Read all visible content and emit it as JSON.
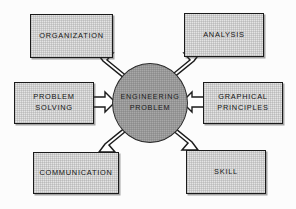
{
  "diagram": {
    "center": {
      "id": "engineering-problem",
      "label": "ENGINEERING\nPROBLEM",
      "shape": "circle",
      "fill_color": "#a8a8a8",
      "stroke_color": "#2a2a2a"
    },
    "nodes": [
      {
        "id": "organization",
        "label": "ORGANIZATION",
        "position": "top-left",
        "fill_color": "#e4e4e4",
        "stroke_color": "#1b1b1b"
      },
      {
        "id": "analysis",
        "label": "ANALYSIS",
        "position": "top-right",
        "fill_color": "#e4e4e4",
        "stroke_color": "#1b1b1b"
      },
      {
        "id": "problem-solving",
        "label": "PROBLEM\nSOLVING",
        "position": "middle-left",
        "fill_color": "#e4e4e4",
        "stroke_color": "#1b1b1b"
      },
      {
        "id": "graphical-principles",
        "label": "GRAPHICAL\nPRINCIPLES",
        "position": "middle-right",
        "fill_color": "#e4e4e4",
        "stroke_color": "#1b1b1b"
      },
      {
        "id": "communication",
        "label": "COMMUNICATION",
        "position": "bottom-left",
        "fill_color": "#e4e4e4",
        "stroke_color": "#1b1b1b"
      },
      {
        "id": "skill",
        "label": "SKILL",
        "position": "bottom-right",
        "fill_color": "#e4e4e4",
        "stroke_color": "#1b1b1b"
      }
    ],
    "arrows": [
      {
        "id": "arrow-organization-to-center",
        "from": "organization",
        "to": "engineering-problem",
        "direction": "down-right",
        "style": "outlined-white"
      },
      {
        "id": "arrow-analysis-to-center",
        "from": "analysis",
        "to": "engineering-problem",
        "direction": "down-left",
        "style": "outlined-white"
      },
      {
        "id": "arrow-communication-to-center",
        "from": "communication",
        "to": "engineering-problem",
        "direction": "up-right",
        "style": "outlined-white"
      },
      {
        "id": "arrow-skill-to-center",
        "from": "skill",
        "to": "engineering-problem",
        "direction": "up-left",
        "style": "outlined-white"
      },
      {
        "id": "arrow-problem-solving-to-center",
        "from": "problem-solving",
        "to": "engineering-problem",
        "direction": "right",
        "style": "outlined-white"
      },
      {
        "id": "arrow-graphical-principles-to-center",
        "from": "graphical-principles",
        "to": "engineering-problem",
        "direction": "left",
        "style": "outlined-white"
      }
    ]
  }
}
